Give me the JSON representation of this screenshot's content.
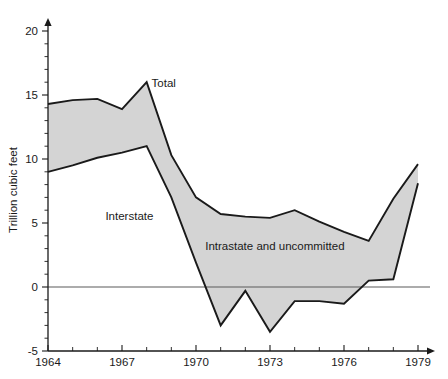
{
  "chart_data": {
    "type": "area",
    "title": "",
    "xlabel": "",
    "ylabel": "Trillion cubic feet",
    "xlim": [
      1964,
      1979
    ],
    "ylim": [
      -5,
      21
    ],
    "grid": false,
    "legend_position": "inline-annotations",
    "x": [
      1964,
      1965,
      1966,
      1967,
      1968,
      1969,
      1970,
      1971,
      1972,
      1973,
      1974,
      1975,
      1976,
      1977,
      1978,
      1979
    ],
    "y_tick_labels": [
      "-5",
      "0",
      "5",
      "10",
      "15",
      "20"
    ],
    "y_tick_values": [
      -5,
      0,
      5,
      10,
      15,
      20
    ],
    "y_minor_step": 1,
    "x_tick_labels": [
      "1964",
      "1967",
      "1970",
      "1973",
      "1976",
      "1979"
    ],
    "x_tick_values": [
      1964,
      1967,
      1970,
      1973,
      1976,
      1979
    ],
    "x_minor_step": 1,
    "series": [
      {
        "name": "Total",
        "values": [
          14.3,
          14.6,
          14.7,
          13.9,
          16.0,
          10.3,
          7.0,
          5.7,
          5.5,
          5.4,
          6.0,
          5.1,
          4.3,
          3.6,
          6.9,
          9.6
        ]
      },
      {
        "name": "Interstate",
        "values": [
          9.0,
          9.5,
          10.1,
          10.5,
          11.0,
          7.0,
          1.9,
          -3.0,
          -0.3,
          -3.5,
          -1.1,
          -1.1,
          -1.3,
          0.5,
          0.6,
          8.1
        ]
      }
    ],
    "band_label": "Intrastate and uncommitted",
    "annotations": [
      {
        "text": "Total",
        "x": 1968.2,
        "y": 15.6,
        "align": "start"
      },
      {
        "text": "Interstate",
        "x": 1967.3,
        "y": 5.2,
        "align": "middle"
      },
      {
        "text": "Intrastate and uncommitted",
        "x": 1973.2,
        "y": 2.9,
        "align": "middle"
      }
    ],
    "colors": {
      "band_fill": "#d4d4d4",
      "line": "#1a1a1a",
      "axis": "#1a1a1a",
      "zero_line": "#5a5a5a",
      "background": "#ffffff"
    }
  }
}
